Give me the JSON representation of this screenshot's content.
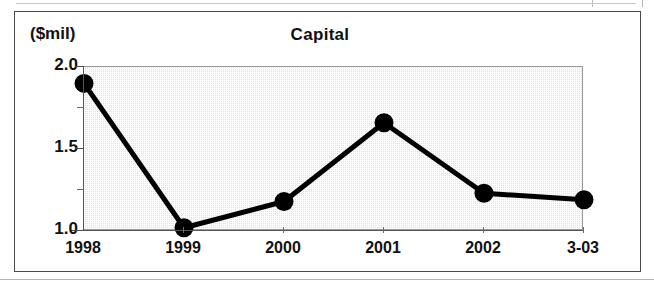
{
  "figure": {
    "title": "Capital",
    "unit_label": "($mil)"
  },
  "chart_data": {
    "type": "line",
    "title": "Capital",
    "subtitle": "",
    "xlabel": "",
    "ylabel": "($mil)",
    "categories": [
      "1998",
      "1999",
      "2000",
      "2001",
      "2002",
      "3-03"
    ],
    "values": [
      1.9,
      1.02,
      1.18,
      1.66,
      1.23,
      1.19
    ],
    "series": [
      {
        "name": "Capital",
        "values": [
          1.9,
          1.02,
          1.18,
          1.66,
          1.23,
          1.19
        ]
      }
    ],
    "ylim": [
      1.0,
      2.0
    ],
    "ytick_labels": [
      "1.0",
      "1.5",
      "2.0"
    ],
    "ytick_values": [
      1.0,
      1.5,
      2.0
    ],
    "yminor_tick_values": [
      1.25,
      1.75
    ],
    "xtick_labels": [
      "1998",
      "1999",
      "2000",
      "2001",
      "2002",
      "3-03"
    ],
    "grid": false,
    "legend": "none",
    "marker": "filled-circle",
    "line_color": "#000000",
    "marker_color": "#000000",
    "plot_background_color": "#e2e2e2",
    "frame_color": "#4a4a4a"
  },
  "y_axis": {
    "ticks": [
      {
        "label": "2.0",
        "value": 2.0
      },
      {
        "label": "1.5",
        "value": 1.5
      },
      {
        "label": "1.0",
        "value": 1.0
      }
    ]
  },
  "x_axis": {
    "ticks": [
      {
        "label": "1998"
      },
      {
        "label": "1999"
      },
      {
        "label": "2000"
      },
      {
        "label": "2001"
      },
      {
        "label": "2002"
      },
      {
        "label": "3-03"
      }
    ]
  }
}
